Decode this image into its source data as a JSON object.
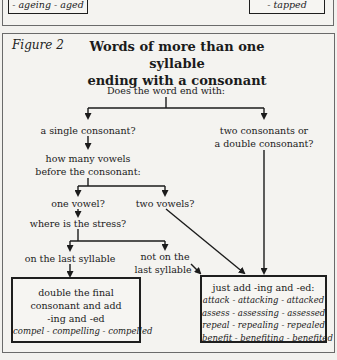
{
  "previous_panel": {
    "left_box_tail": "- ageing - aged",
    "right_box_tail": "- tapped"
  },
  "figure": {
    "label": "Figure 2",
    "title_line1": "Words of more than one syllable",
    "title_line2": "ending with a consonant"
  },
  "nodes": {
    "root": "Does the word end with:",
    "single_consonant": "a single consonant?",
    "two_consonants_line1": "two consonants or",
    "two_consonants_line2": "a double consonant?",
    "how_many_line1": "how many vowels",
    "how_many_line2": "before the consonant:",
    "one_vowel": "one vowel?",
    "two_vowels": "two vowels?",
    "where_stress": "where is the stress?",
    "last_syllable": "on the last syllable",
    "not_last_line1": "not on the",
    "not_last_line2": "last syllable"
  },
  "outcomes": {
    "double": {
      "line1": "double the final",
      "line2": "consonant and add",
      "line3": "-ing and -ed",
      "example": "compel - compelling - compelled"
    },
    "just_add": {
      "heading": "just add -ing and -ed:",
      "examples": [
        "attack - attacking - attacked",
        "assess - assessing - assessed",
        "repeal - repealing - repealed",
        "benefit - benefiting - benefited"
      ]
    }
  },
  "colors": {
    "background": "#f2f1ee",
    "ink": "#1b1b1b",
    "frame": "#6a6a6a"
  }
}
